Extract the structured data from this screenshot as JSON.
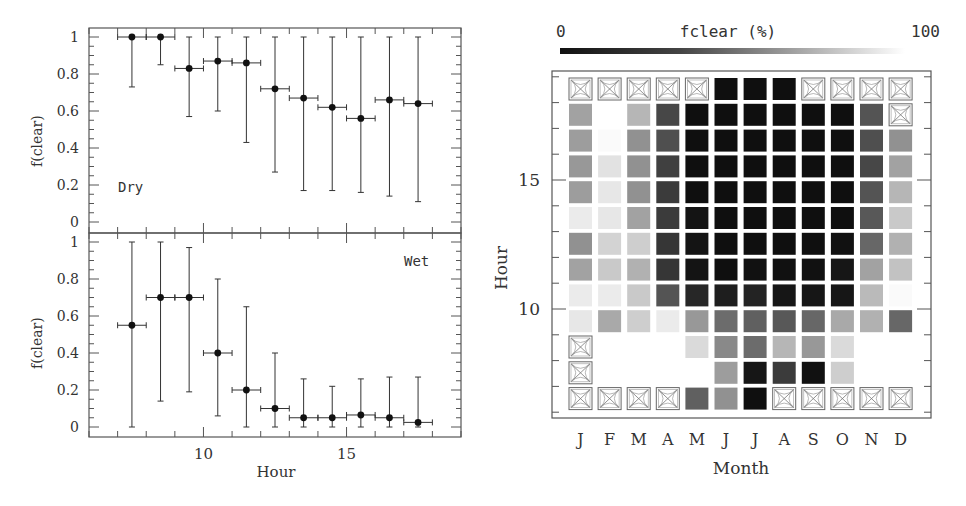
{
  "chart_data": [
    {
      "id": "dry",
      "type": "scatter",
      "panel": "left-top",
      "title": "",
      "annotation": "Dry",
      "xlabel": "Hour",
      "ylabel": "f(clear)",
      "xlim": [
        6,
        19
      ],
      "ylim": [
        -0.05,
        1.05
      ],
      "yticks": [
        0,
        0.2,
        0.4,
        0.6,
        0.8,
        1
      ],
      "ytick_labels": [
        "0",
        "0.2",
        "0.4",
        "0.6",
        "0.8",
        "1"
      ],
      "x": [
        7.5,
        8.5,
        9.5,
        10.5,
        11.5,
        12.5,
        13.5,
        14.5,
        15.5,
        16.5,
        17.5
      ],
      "y": [
        1.0,
        1.0,
        0.83,
        0.87,
        0.86,
        0.72,
        0.67,
        0.62,
        0.56,
        0.66,
        0.64
      ],
      "x_err": 0.5,
      "y_low": [
        0.73,
        0.85,
        0.57,
        0.6,
        0.43,
        0.27,
        0.17,
        0.17,
        0.16,
        0.14,
        0.11
      ],
      "y_high": [
        1.0,
        1.0,
        1.0,
        1.0,
        1.0,
        1.0,
        1.0,
        1.0,
        1.0,
        1.0,
        1.0
      ]
    },
    {
      "id": "wet",
      "type": "scatter",
      "panel": "left-bottom",
      "title": "",
      "annotation": "Wet",
      "xlabel": "Hour",
      "ylabel": "f(clear)",
      "xlim": [
        6,
        19
      ],
      "ylim": [
        -0.05,
        1.05
      ],
      "xticks": [
        10,
        15
      ],
      "xtick_labels": [
        "10",
        "15"
      ],
      "yticks": [
        0,
        0.2,
        0.4,
        0.6,
        0.8,
        1
      ],
      "ytick_labels": [
        "0",
        "0.2",
        "0.4",
        "0.6",
        "0.8",
        "1"
      ],
      "x": [
        7.5,
        8.5,
        9.5,
        10.5,
        11.5,
        12.5,
        13.5,
        14.5,
        15.5,
        16.5,
        17.5
      ],
      "y": [
        0.55,
        0.7,
        0.7,
        0.4,
        0.2,
        0.1,
        0.05,
        0.05,
        0.065,
        0.05,
        0.025
      ],
      "x_err": 0.5,
      "y_low": [
        0.0,
        0.14,
        0.19,
        0.06,
        0.0,
        0.0,
        0.0,
        0.0,
        0.0,
        0.0,
        0.0
      ],
      "y_high": [
        1.0,
        1.0,
        0.97,
        0.8,
        0.65,
        0.4,
        0.26,
        0.22,
        0.26,
        0.27,
        0.27
      ]
    },
    {
      "id": "monthly-hourly",
      "type": "heatmap",
      "panel": "right",
      "title": "fclear (%)",
      "colorbar": {
        "label": "fclear (%)",
        "min_label": "0",
        "max_label": "100",
        "min": 0,
        "max": 100,
        "cmap": "black-to-white"
      },
      "xlabel": "Month",
      "ylabel": "Hour",
      "categories": [
        "J",
        "F",
        "M",
        "A",
        "M",
        "J",
        "J",
        "A",
        "S",
        "O",
        "N",
        "D"
      ],
      "hours": [
        18,
        17,
        16,
        15,
        14,
        13,
        12,
        11,
        10,
        9,
        8,
        7,
        6
      ],
      "yticks": [
        10,
        15
      ],
      "ytick_labels": [
        "10",
        "15"
      ],
      "no_data_value": null,
      "grid_note": "rows ordered top (hour 18) to bottom (hour 6); values are fclear %; null = no data (crossed box)",
      "values": [
        [
          null,
          null,
          null,
          null,
          null,
          2,
          2,
          2,
          null,
          null,
          null,
          null
        ],
        [
          62,
          100,
          70,
          25,
          2,
          2,
          2,
          2,
          2,
          2,
          30,
          null
        ],
        [
          60,
          98,
          55,
          28,
          2,
          2,
          2,
          2,
          2,
          2,
          28,
          55
        ],
        [
          58,
          88,
          55,
          22,
          2,
          2,
          2,
          2,
          2,
          2,
          25,
          62
        ],
        [
          60,
          90,
          55,
          20,
          2,
          2,
          2,
          2,
          2,
          2,
          30,
          70
        ],
        [
          92,
          90,
          62,
          20,
          4,
          2,
          2,
          2,
          2,
          2,
          32,
          78
        ],
        [
          55,
          82,
          80,
          18,
          4,
          2,
          2,
          2,
          2,
          3,
          38,
          68
        ],
        [
          62,
          78,
          68,
          18,
          4,
          2,
          3,
          3,
          3,
          5,
          62,
          75
        ],
        [
          92,
          92,
          78,
          30,
          12,
          8,
          10,
          5,
          5,
          5,
          72,
          98
        ],
        [
          90,
          65,
          80,
          92,
          58,
          40,
          35,
          32,
          38,
          65,
          68,
          38
        ],
        [
          null,
          100,
          100,
          100,
          85,
          52,
          40,
          70,
          58,
          85,
          100,
          100
        ],
        [
          null,
          100,
          100,
          100,
          100,
          60,
          5,
          20,
          3,
          80,
          100,
          100
        ],
        [
          null,
          null,
          null,
          null,
          35,
          55,
          2,
          null,
          null,
          null,
          null,
          null
        ]
      ]
    }
  ],
  "labels": {
    "left_ylabel_top": "f(clear)",
    "left_ylabel_bottom": "f(clear)",
    "left_xlabel": "Hour",
    "dry_label": "Dry",
    "wet_label": "Wet",
    "right_title": "fclear (%)",
    "right_cb_min": "0",
    "right_cb_max": "100",
    "right_xlabel": "Month",
    "right_ylabel": "Hour"
  }
}
